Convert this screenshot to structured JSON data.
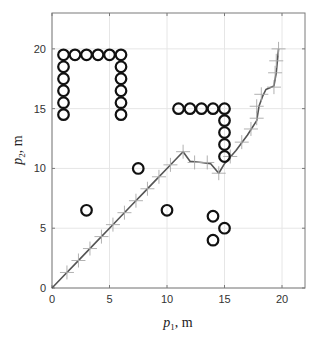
{
  "chart_data": {
    "type": "scatter",
    "title": "",
    "xlabel": "p1, m",
    "ylabel": "p2, m",
    "xlabel_parts": {
      "var": "p",
      "sub": "1",
      "unit": ", m"
    },
    "ylabel_parts": {
      "var": "p",
      "sub": "2",
      "unit": ", m"
    },
    "xlim": [
      0,
      22
    ],
    "ylim": [
      0,
      23
    ],
    "xticks": [
      0,
      5,
      10,
      15,
      20
    ],
    "yticks": [
      0,
      5,
      10,
      15,
      20
    ],
    "grid": true,
    "legend": null,
    "series": [
      {
        "name": "obstacles",
        "style": "circle-marker",
        "color": "#111111",
        "points": [
          [
            1,
            19.5
          ],
          [
            2,
            19.5
          ],
          [
            3,
            19.5
          ],
          [
            4,
            19.5
          ],
          [
            5,
            19.5
          ],
          [
            6,
            19.5
          ],
          [
            1,
            18.5
          ],
          [
            1,
            17.5
          ],
          [
            1,
            16.5
          ],
          [
            1,
            15.5
          ],
          [
            1,
            14.5
          ],
          [
            6,
            18.5
          ],
          [
            6,
            17.5
          ],
          [
            6,
            16.5
          ],
          [
            6,
            15.5
          ],
          [
            6,
            14.5
          ],
          [
            11,
            15
          ],
          [
            12,
            15
          ],
          [
            13,
            15
          ],
          [
            14,
            15
          ],
          [
            15,
            15
          ],
          [
            15,
            14
          ],
          [
            15,
            13
          ],
          [
            15,
            12
          ],
          [
            15,
            11
          ],
          [
            7.5,
            10
          ],
          [
            3,
            6.5
          ],
          [
            10,
            6.5
          ],
          [
            14,
            6
          ],
          [
            15,
            5
          ],
          [
            14,
            4
          ]
        ]
      },
      {
        "name": "trajectory",
        "style": "line-with-plus-markers",
        "color": "#555555",
        "points": [
          [
            0,
            0
          ],
          [
            1,
            1
          ],
          [
            2,
            2
          ],
          [
            3,
            3
          ],
          [
            4,
            4
          ],
          [
            5,
            5
          ],
          [
            6,
            6
          ],
          [
            7,
            7
          ],
          [
            8,
            8
          ],
          [
            9,
            9
          ],
          [
            10,
            10
          ],
          [
            11,
            11
          ],
          [
            11.4,
            11.4
          ],
          [
            12,
            10.6
          ],
          [
            13,
            10.5
          ],
          [
            13.8,
            10.4
          ],
          [
            14.5,
            9.6
          ],
          [
            15,
            10.4
          ],
          [
            16,
            11.5
          ],
          [
            17,
            12.8
          ],
          [
            17.8,
            14
          ],
          [
            18,
            15.2
          ],
          [
            18.3,
            16
          ],
          [
            18.6,
            16.6
          ],
          [
            19.3,
            16.9
          ],
          [
            19.5,
            18
          ],
          [
            19.6,
            19
          ],
          [
            19.7,
            20
          ]
        ],
        "markers": [
          [
            1.3,
            1.3
          ],
          [
            2.3,
            2.3
          ],
          [
            3.3,
            3.3
          ],
          [
            4.3,
            4.3
          ],
          [
            5.3,
            5.3
          ],
          [
            6.3,
            6.3
          ],
          [
            7.3,
            7.3
          ],
          [
            8.3,
            8.3
          ],
          [
            9.3,
            9.3
          ],
          [
            10.3,
            10.3
          ],
          [
            11.4,
            11.4
          ],
          [
            12.4,
            10.5
          ],
          [
            13.5,
            10.5
          ],
          [
            14.5,
            9.6
          ],
          [
            15.5,
            11
          ],
          [
            16.5,
            12.2
          ],
          [
            17.3,
            13.3
          ],
          [
            17.8,
            14.2
          ],
          [
            17.8,
            15.2
          ],
          [
            18.2,
            16.2
          ],
          [
            19.3,
            16.8
          ],
          [
            19.4,
            18
          ],
          [
            19.5,
            19
          ],
          [
            19.7,
            20
          ]
        ]
      }
    ]
  }
}
